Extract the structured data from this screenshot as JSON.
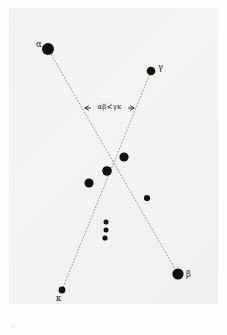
{
  "figure": {
    "kind": "star-chart-plate",
    "background_color": "#f3f3f1",
    "ink_color": "#111111",
    "line_color": "#9a9a96",
    "plate_mark": "ll"
  },
  "annotation": {
    "dimension_text": "αβ≮γκ",
    "arrow_left_x": 85,
    "arrow_right_x": 134,
    "arrow_y": 108
  },
  "chart_data": {
    "type": "scatter",
    "title": "",
    "xlabel": "",
    "ylabel": "",
    "xlim": [
      0,
      227
    ],
    "ylim": [
      0,
      335
    ],
    "grid": false,
    "legend": "none",
    "points": [
      {
        "name": "alpha",
        "label": "α",
        "x": 48,
        "y": 49,
        "r": 6.0,
        "label_dx": -12,
        "label_dy": -4
      },
      {
        "name": "gamma",
        "label": "γ",
        "x": 151,
        "y": 71,
        "r": 4.3,
        "label_dx": 7,
        "label_dy": -3
      },
      {
        "name": "star-1",
        "label": "",
        "x": 124,
        "y": 157,
        "r": 4.6,
        "label_dx": 0,
        "label_dy": 0
      },
      {
        "name": "star-2",
        "label": "",
        "x": 107,
        "y": 171,
        "r": 4.8,
        "label_dx": 0,
        "label_dy": 0
      },
      {
        "name": "star-3",
        "label": "",
        "x": 89,
        "y": 183,
        "r": 4.5,
        "label_dx": 0,
        "label_dy": 0
      },
      {
        "name": "star-4",
        "label": "",
        "x": 147,
        "y": 198,
        "r": 3.1,
        "label_dx": 0,
        "label_dy": 0
      },
      {
        "name": "star-5",
        "label": "",
        "x": 106,
        "y": 222,
        "r": 2.5,
        "label_dx": 0,
        "label_dy": 0
      },
      {
        "name": "star-6",
        "label": "",
        "x": 106,
        "y": 230,
        "r": 2.5,
        "label_dx": 0,
        "label_dy": 0
      },
      {
        "name": "star-7",
        "label": "",
        "x": 105,
        "y": 238,
        "r": 2.6,
        "label_dx": 0,
        "label_dy": 0
      },
      {
        "name": "beta",
        "label": "β",
        "x": 178,
        "y": 274,
        "r": 5.6,
        "label_dx": 8,
        "label_dy": 1
      },
      {
        "name": "kappa",
        "label": "κ",
        "x": 62,
        "y": 290,
        "r": 3.4,
        "label_dx": -6,
        "label_dy": 9
      }
    ],
    "lines": [
      {
        "name": "alpha-beta-line",
        "x1": 48,
        "y1": 49,
        "x2": 178,
        "y2": 274,
        "style": "dotted"
      },
      {
        "name": "kappa-gamma-line",
        "x1": 62,
        "y1": 290,
        "x2": 151,
        "y2": 71,
        "style": "dotted"
      }
    ],
    "crossing_point": {
      "x": 115,
      "y": 163
    }
  }
}
